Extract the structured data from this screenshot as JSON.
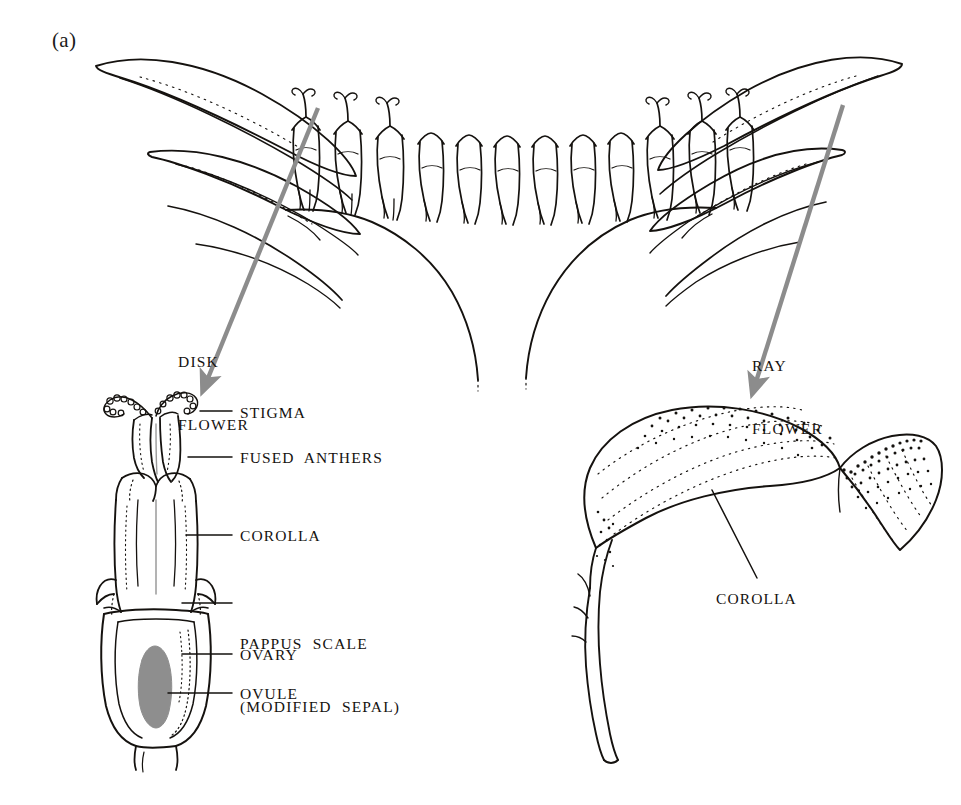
{
  "figure": {
    "panel_letter": "(a)",
    "ink_color": "#15120f",
    "arrow_color": "#8c8c8c",
    "ovule_fill": "#8e8e8e",
    "background": "#ffffff"
  },
  "pointer_labels": [
    {
      "id": "disk-flower",
      "line1": "DISK",
      "line2": "FLOWER",
      "x": 178,
      "y": 310,
      "arrow": {
        "x1": 318,
        "y1": 108,
        "x2": 206,
        "y2": 383
      }
    },
    {
      "id": "ray-flower",
      "line1": "RAY",
      "line2": "FLOWER",
      "x": 752,
      "y": 314,
      "arrow": {
        "x1": 843,
        "y1": 105,
        "x2": 755,
        "y2": 385
      }
    }
  ],
  "disk_flower_callouts": [
    {
      "id": "stigma",
      "label": "STIGMA",
      "text_x": 240,
      "text_y": 403,
      "leader": {
        "x1": 200,
        "y1": 411,
        "x2": 232,
        "y2": 411
      }
    },
    {
      "id": "fused-anthers",
      "label": "FUSED  ANTHERS",
      "text_x": 240,
      "text_y": 448,
      "leader": {
        "x1": 188,
        "y1": 457,
        "x2": 232,
        "y2": 457
      }
    },
    {
      "id": "corolla-disk",
      "label": "COROLLA",
      "text_x": 240,
      "text_y": 526,
      "leader": {
        "x1": 186,
        "y1": 535,
        "x2": 232,
        "y2": 535
      }
    },
    {
      "id": "ovary",
      "label": "OVARY",
      "text_x": 240,
      "text_y": 645,
      "leader": {
        "x1": 182,
        "y1": 654,
        "x2": 232,
        "y2": 654
      }
    },
    {
      "id": "ovule",
      "label": "OVULE",
      "text_x": 240,
      "text_y": 684,
      "leader": {
        "x1": 168,
        "y1": 693,
        "x2": 232,
        "y2": 693
      }
    }
  ],
  "pappus_callout": {
    "id": "pappus-scale",
    "line1": "PAPPUS  SCALE",
    "line2": "(MODIFIED  SEPAL)",
    "text_x": 240,
    "text_y": 592,
    "leader": {
      "x1": 182,
      "y1": 603,
      "x2": 232,
      "y2": 603
    }
  },
  "ray_flower_callout": {
    "id": "corolla-ray",
    "label": "COROLLA",
    "text_x": 716,
    "text_y": 589,
    "leader": {
      "x1": 757,
      "y1": 578,
      "x2": 712,
      "y2": 490
    }
  }
}
